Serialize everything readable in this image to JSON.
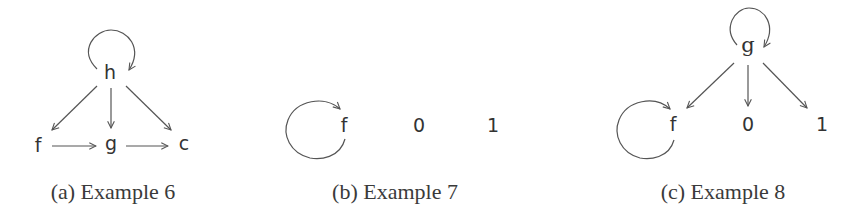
{
  "panels": [
    {
      "id": "a",
      "caption": "(a) Example 6",
      "nodes": [
        {
          "id": "h",
          "label": "h",
          "x": 110,
          "y": 79
        },
        {
          "id": "f",
          "label": "f",
          "x": 38,
          "y": 152
        },
        {
          "id": "g",
          "label": "g",
          "x": 111,
          "y": 150
        },
        {
          "id": "c",
          "label": "c",
          "x": 184,
          "y": 150
        }
      ],
      "edges": [
        {
          "from": "h",
          "to": "h",
          "type": "self-loop"
        },
        {
          "from": "h",
          "to": "f"
        },
        {
          "from": "h",
          "to": "g"
        },
        {
          "from": "h",
          "to": "c"
        },
        {
          "from": "f",
          "to": "g"
        },
        {
          "from": "g",
          "to": "c"
        }
      ]
    },
    {
      "id": "b",
      "caption": "(b) Example 7",
      "nodes": [
        {
          "id": "f",
          "label": "f",
          "x": 344,
          "y": 132
        },
        {
          "id": "0",
          "label": "0",
          "x": 419,
          "y": 132
        },
        {
          "id": "1",
          "label": "1",
          "x": 493,
          "y": 132
        }
      ],
      "edges": [
        {
          "from": "f",
          "to": "f",
          "type": "self-loop"
        }
      ]
    },
    {
      "id": "c",
      "caption": "(c) Example 8",
      "nodes": [
        {
          "id": "g",
          "label": "g",
          "x": 748,
          "y": 52
        },
        {
          "id": "f",
          "label": "f",
          "x": 673,
          "y": 131
        },
        {
          "id": "0",
          "label": "0",
          "x": 748,
          "y": 131
        },
        {
          "id": "1",
          "label": "1",
          "x": 822,
          "y": 131
        }
      ],
      "edges": [
        {
          "from": "g",
          "to": "g",
          "type": "self-loop"
        },
        {
          "from": "g",
          "to": "f"
        },
        {
          "from": "g",
          "to": "0"
        },
        {
          "from": "g",
          "to": "1"
        },
        {
          "from": "f",
          "to": "f",
          "type": "self-loop"
        }
      ]
    }
  ]
}
